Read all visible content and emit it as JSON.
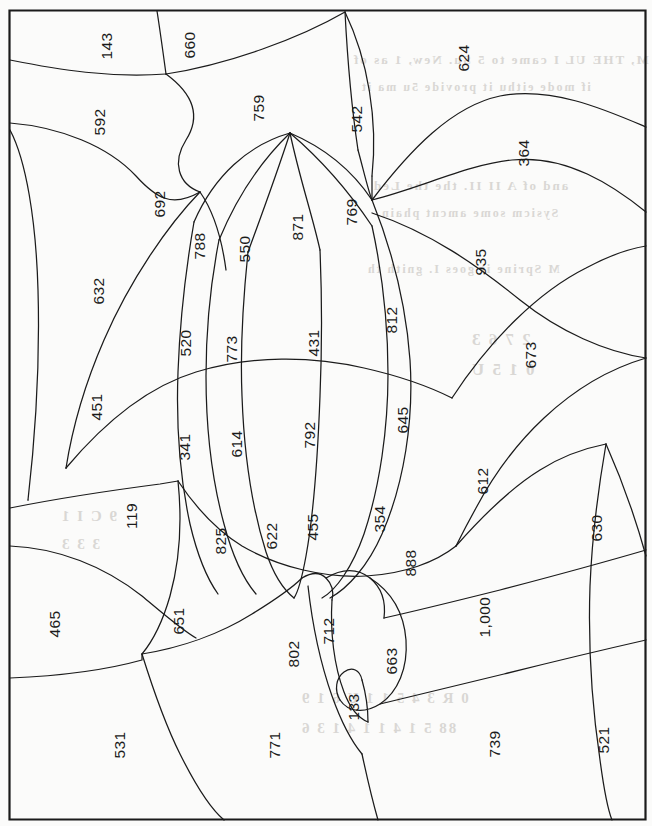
{
  "document": {
    "kind": "region-partition-map",
    "orientation": "rotated-90-ccw",
    "border_color": "#1b1b1b",
    "line_color": "#1b1b1b",
    "paper_color": "#fbfbfa",
    "label_count": 45
  },
  "regions": [
    {
      "id": "r-143",
      "value": "143",
      "x": 107,
      "y": 46
    },
    {
      "id": "r-660",
      "value": "660",
      "x": 190,
      "y": 45
    },
    {
      "id": "r-624",
      "value": "624",
      "x": 464,
      "y": 58
    },
    {
      "id": "r-592",
      "value": "592",
      "x": 100,
      "y": 122
    },
    {
      "id": "r-759",
      "value": "759",
      "x": 259,
      "y": 108
    },
    {
      "id": "r-542",
      "value": "542",
      "x": 357,
      "y": 119
    },
    {
      "id": "r-364",
      "value": "364",
      "x": 524,
      "y": 153
    },
    {
      "id": "r-692",
      "value": "692",
      "x": 160,
      "y": 204
    },
    {
      "id": "r-769",
      "value": "769",
      "x": 352,
      "y": 212
    },
    {
      "id": "r-788",
      "value": "788",
      "x": 200,
      "y": 246
    },
    {
      "id": "r-550",
      "value": "550",
      "x": 245,
      "y": 249
    },
    {
      "id": "r-871",
      "value": "871",
      "x": 298,
      "y": 227
    },
    {
      "id": "r-935",
      "value": "935",
      "x": 481,
      "y": 262
    },
    {
      "id": "r-632",
      "value": "632",
      "x": 99,
      "y": 291
    },
    {
      "id": "r-520",
      "value": "520",
      "x": 186,
      "y": 343
    },
    {
      "id": "r-773",
      "value": "773",
      "x": 232,
      "y": 349
    },
    {
      "id": "r-431",
      "value": "431",
      "x": 314,
      "y": 343
    },
    {
      "id": "r-812",
      "value": "812",
      "x": 392,
      "y": 320
    },
    {
      "id": "r-673",
      "value": "673",
      "x": 531,
      "y": 355
    },
    {
      "id": "r-451",
      "value": "451",
      "x": 97,
      "y": 407
    },
    {
      "id": "r-341",
      "value": "341",
      "x": 185,
      "y": 447
    },
    {
      "id": "r-614",
      "value": "614",
      "x": 237,
      "y": 444
    },
    {
      "id": "r-792",
      "value": "792",
      "x": 310,
      "y": 435
    },
    {
      "id": "r-645",
      "value": "645",
      "x": 403,
      "y": 420
    },
    {
      "id": "r-612",
      "value": "612",
      "x": 483,
      "y": 481
    },
    {
      "id": "r-119",
      "value": "119",
      "x": 132,
      "y": 516
    },
    {
      "id": "r-825",
      "value": "825",
      "x": 221,
      "y": 541
    },
    {
      "id": "r-622",
      "value": "622",
      "x": 272,
      "y": 536
    },
    {
      "id": "r-455",
      "value": "455",
      "x": 313,
      "y": 527
    },
    {
      "id": "r-354",
      "value": "354",
      "x": 380,
      "y": 519
    },
    {
      "id": "r-630",
      "value": "630",
      "x": 597,
      "y": 528
    },
    {
      "id": "r-888",
      "value": "888",
      "x": 411,
      "y": 563
    },
    {
      "id": "r-465",
      "value": "465",
      "x": 55,
      "y": 624
    },
    {
      "id": "r-651",
      "value": "651",
      "x": 179,
      "y": 621
    },
    {
      "id": "r-712",
      "value": "712",
      "x": 329,
      "y": 631
    },
    {
      "id": "r-802",
      "value": "802",
      "x": 294,
      "y": 654
    },
    {
      "id": "r-663",
      "value": "663",
      "x": 392,
      "y": 661
    },
    {
      "id": "r-1000",
      "value": "1,000",
      "x": 485,
      "y": 617
    },
    {
      "id": "r-133",
      "value": "133",
      "x": 354,
      "y": 707
    },
    {
      "id": "r-531",
      "value": "531",
      "x": 120,
      "y": 745
    },
    {
      "id": "r-771",
      "value": "771",
      "x": 275,
      "y": 745
    },
    {
      "id": "r-739",
      "value": "739",
      "x": 495,
      "y": 744
    },
    {
      "id": "r-521",
      "value": "521",
      "x": 604,
      "y": 740
    }
  ],
  "bleed_text": [
    {
      "text": "M, THE UL I came to 5 Su. New, 1 as of",
      "x": 352,
      "y": 52,
      "size": 13
    },
    {
      "text": "if  mode  eithu  it  provide  5u ma  it",
      "x": 360,
      "y": 80,
      "size": 12
    },
    {
      "text": "and  of  A II  II.  the  the Led",
      "x": 372,
      "y": 178,
      "size": 13
    },
    {
      "text": "Sysicm  some  amcnt  phain",
      "x": 380,
      "y": 206,
      "size": 12
    },
    {
      "text": "M  Sprine  it  goes  I.  gnith  th",
      "x": 366,
      "y": 262,
      "size": 12
    },
    {
      "text": "2  7  6  3",
      "x": 470,
      "y": 330,
      "size": 17
    },
    {
      "text": "0  1  5  U",
      "x": 470,
      "y": 360,
      "size": 17
    },
    {
      "text": "9   C  I  1",
      "x": 60,
      "y": 508,
      "size": 15
    },
    {
      "text": "3   3   3",
      "x": 60,
      "y": 536,
      "size": 15
    },
    {
      "text": "0  R  3   4 5 1   1  U   6   1 9",
      "x": 300,
      "y": 690,
      "size": 15
    },
    {
      "text": "88  5  1  4  1  1  4  1  3  6",
      "x": 300,
      "y": 720,
      "size": 15
    }
  ]
}
